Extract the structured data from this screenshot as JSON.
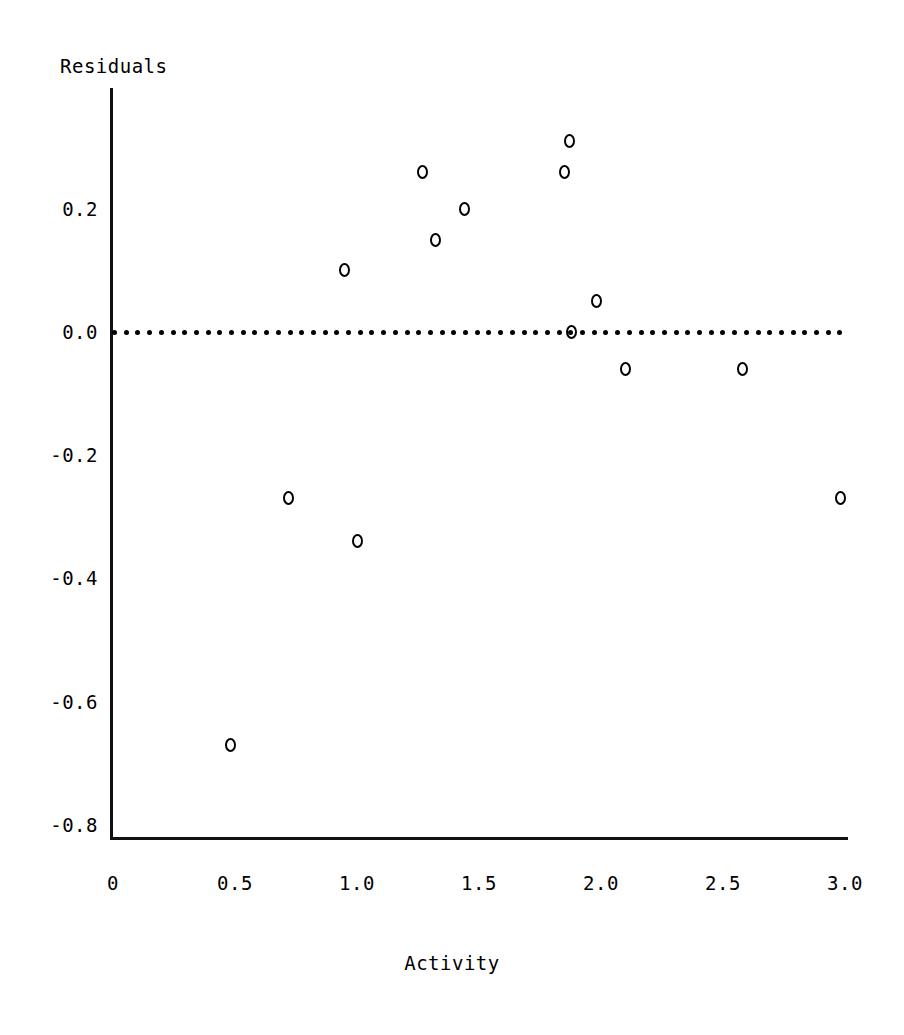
{
  "chart_data": {
    "type": "scatter",
    "title": "",
    "xlabel": "Activity",
    "ylabel": "Residuals",
    "xlim": [
      0.0,
      3.0
    ],
    "ylim": [
      -0.8,
      0.35
    ],
    "grid": false,
    "legend": null,
    "xticks": [
      "0",
      "0.5",
      "1.0",
      "1.5",
      "2.0",
      "2.5",
      "3.0"
    ],
    "xtick_values": [
      0,
      0.5,
      1.0,
      1.5,
      2.0,
      2.5,
      3.0
    ],
    "yticks": [
      "0.2",
      "0.0",
      "-0.2",
      "-0.4",
      "-0.6",
      "-0.8"
    ],
    "ytick_values": [
      0.2,
      0.0,
      -0.2,
      -0.4,
      -0.6,
      -0.8
    ],
    "marker": "open-circle",
    "marker_color": "#000000",
    "reference_line": {
      "name": "zero-reference-line",
      "y": 0.0,
      "style": "dotted",
      "color": "#000000"
    },
    "x": [
      0.48,
      0.72,
      0.95,
      1.0,
      1.27,
      1.32,
      1.44,
      1.85,
      1.87,
      1.88,
      1.98,
      2.1,
      2.58,
      2.98
    ],
    "y": [
      -0.67,
      -0.27,
      0.1,
      -0.34,
      0.26,
      0.15,
      0.2,
      0.26,
      0.31,
      0.0,
      0.05,
      -0.06,
      -0.06,
      -0.27
    ],
    "points": [
      {
        "x": 0.48,
        "y": -0.67
      },
      {
        "x": 0.72,
        "y": -0.27
      },
      {
        "x": 0.95,
        "y": 0.1
      },
      {
        "x": 1.0,
        "y": -0.34
      },
      {
        "x": 1.27,
        "y": 0.26
      },
      {
        "x": 1.32,
        "y": 0.15
      },
      {
        "x": 1.44,
        "y": 0.2
      },
      {
        "x": 1.85,
        "y": 0.26
      },
      {
        "x": 1.87,
        "y": 0.31
      },
      {
        "x": 1.88,
        "y": 0.0
      },
      {
        "x": 1.98,
        "y": 0.05
      },
      {
        "x": 2.1,
        "y": -0.06
      },
      {
        "x": 2.58,
        "y": -0.06
      },
      {
        "x": 2.98,
        "y": -0.27
      }
    ]
  },
  "axes": {
    "y_axis_title": "Residuals",
    "x_axis_title": "Activity"
  },
  "geometry": {
    "x_px_at_0": 113,
    "x_px_per_unit": 244,
    "y_px_at_0": 332,
    "y_px_per_unit": 616
  }
}
